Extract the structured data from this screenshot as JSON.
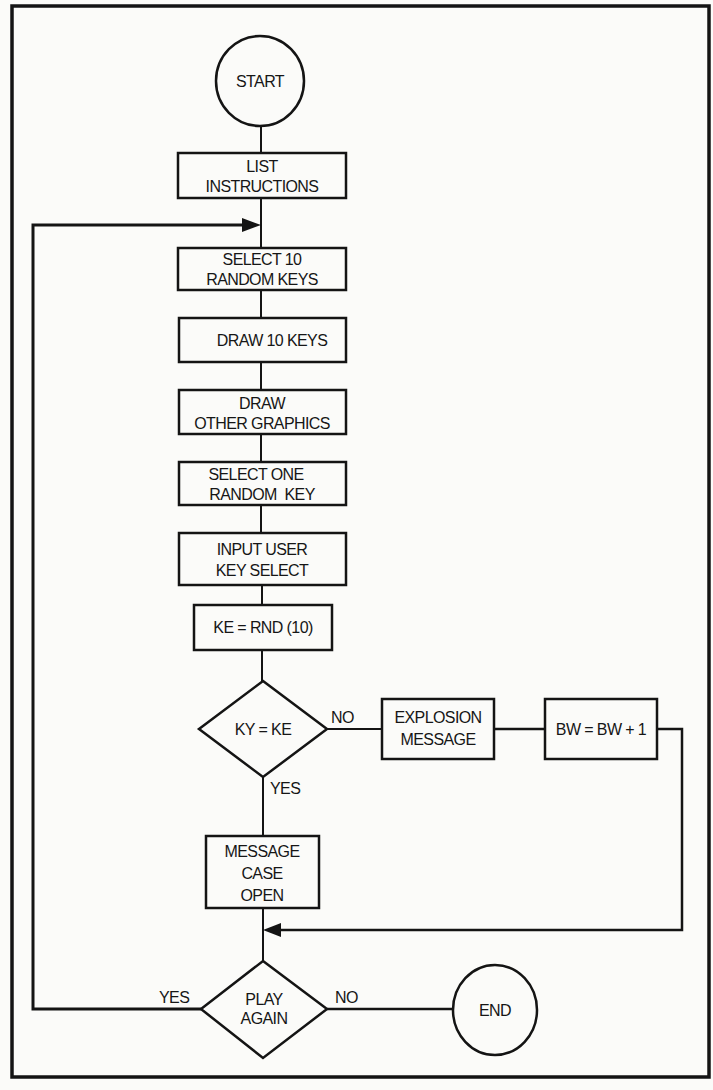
{
  "diagram": {
    "type": "flowchart",
    "colors": {
      "ink": "#141414",
      "paper": "#fbfbf9"
    },
    "nodes": {
      "start": {
        "shape": "circle",
        "label": "START"
      },
      "list_instructions": {
        "shape": "rect",
        "line1": "LIST",
        "line2": "INSTRUCTIONS"
      },
      "select_10": {
        "shape": "rect",
        "line1": "SELECT 10",
        "line2": "RANDOM KEYS"
      },
      "draw_10": {
        "shape": "rect",
        "line1": "DRAW 10 KEYS"
      },
      "draw_other": {
        "shape": "rect",
        "line1": "DRAW",
        "line2": "OTHER GRAPHICS"
      },
      "select_one": {
        "shape": "rect",
        "line1": "SELECT ONE",
        "line2": "RANDOM  KEY"
      },
      "input_user": {
        "shape": "rect",
        "line1": "INPUT USER",
        "line2": "KEY SELECT"
      },
      "ke_rnd": {
        "shape": "rect",
        "line1": "KE = RND (10)"
      },
      "ky_ke": {
        "shape": "diamond",
        "line1": "KY = KE",
        "yes": "YES",
        "no": "NO"
      },
      "explosion": {
        "shape": "rect",
        "line1": "EXPLOSION",
        "line2": "MESSAGE"
      },
      "bw_inc": {
        "shape": "rect",
        "line1": "BW = BW + 1"
      },
      "message_case": {
        "shape": "rect",
        "line1": "MESSAGE",
        "line2": "CASE",
        "line3": "OPEN"
      },
      "play_again": {
        "shape": "diamond",
        "line1": "PLAY",
        "line2": "AGAIN",
        "yes": "YES",
        "no": "NO"
      },
      "end": {
        "shape": "circle",
        "label": "END"
      }
    },
    "edges": [
      {
        "from": "start",
        "to": "list_instructions"
      },
      {
        "from": "list_instructions",
        "to": "select_10"
      },
      {
        "from": "select_10",
        "to": "draw_10"
      },
      {
        "from": "draw_10",
        "to": "draw_other"
      },
      {
        "from": "draw_other",
        "to": "select_one"
      },
      {
        "from": "select_one",
        "to": "input_user"
      },
      {
        "from": "input_user",
        "to": "ke_rnd"
      },
      {
        "from": "ke_rnd",
        "to": "ky_ke"
      },
      {
        "from": "ky_ke",
        "to": "explosion",
        "label": "NO"
      },
      {
        "from": "explosion",
        "to": "bw_inc"
      },
      {
        "from": "ky_ke",
        "to": "message_case",
        "label": "YES"
      },
      {
        "from": "bw_inc",
        "to": "play_again"
      },
      {
        "from": "message_case",
        "to": "play_again"
      },
      {
        "from": "play_again",
        "to": "select_10",
        "label": "YES"
      },
      {
        "from": "play_again",
        "to": "end",
        "label": "NO"
      }
    ]
  }
}
